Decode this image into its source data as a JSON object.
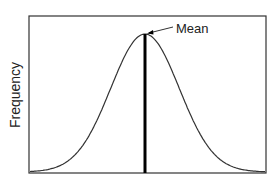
{
  "chart_data": {
    "type": "line",
    "title": "",
    "xlabel": "",
    "ylabel": "Frequency",
    "series": [
      {
        "name": "normal distribution curve",
        "distribution": "normal",
        "mean": 0,
        "sd": 1,
        "x_range": [
          -3.5,
          3.5
        ]
      }
    ],
    "annotations": [
      {
        "text": "Mean",
        "target": "peak of curve",
        "style": "arrow"
      }
    ],
    "vertical_line": {
      "label": "Mean",
      "x": 0,
      "style": "thick black"
    },
    "grid": false,
    "x_ticks": [],
    "y_ticks": [],
    "legend": null
  },
  "labels": {
    "ylabel": "Frequency",
    "mean_annotation": "Mean"
  },
  "colors": {
    "curve": "#333333",
    "mean_line": "#000000",
    "frame": "#333333"
  }
}
